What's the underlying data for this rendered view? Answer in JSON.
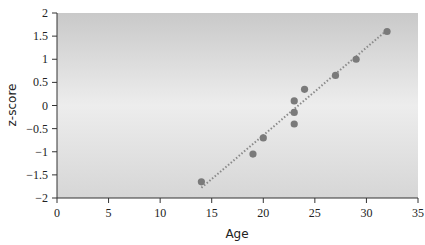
{
  "chart_data": {
    "type": "scatter",
    "title": "",
    "xlabel": "Age",
    "ylabel": "z-score",
    "xlim": [
      0,
      35
    ],
    "ylim": [
      -2,
      2
    ],
    "x_ticks": [
      0,
      5,
      10,
      15,
      20,
      25,
      30,
      35
    ],
    "y_ticks": [
      -2,
      -1.5,
      -1,
      -0.5,
      0,
      0.5,
      1,
      1.5,
      2
    ],
    "x_tick_labels": [
      "0",
      "5",
      "10",
      "15",
      "20",
      "25",
      "30",
      "35"
    ],
    "y_tick_labels": [
      "−2",
      "−1.5",
      "−1",
      "−0.5",
      "0",
      "0.5",
      "1",
      "1.5",
      "2"
    ],
    "grid": false,
    "legend": null,
    "series": [
      {
        "name": "observations",
        "marker": "circle",
        "color": "#7a7a7a",
        "points": [
          {
            "x": 14,
            "y": -1.65
          },
          {
            "x": 19,
            "y": -1.05
          },
          {
            "x": 20,
            "y": -0.7
          },
          {
            "x": 23,
            "y": -0.4
          },
          {
            "x": 23,
            "y": -0.15
          },
          {
            "x": 23,
            "y": 0.1
          },
          {
            "x": 24,
            "y": 0.35
          },
          {
            "x": 27,
            "y": 0.65
          },
          {
            "x": 29,
            "y": 1.0
          },
          {
            "x": 32,
            "y": 1.6
          }
        ]
      },
      {
        "name": "trend line",
        "style": "dotted",
        "color": "#8a8a8a",
        "points": [
          {
            "x": 14,
            "y": -1.78
          },
          {
            "x": 32,
            "y": 1.63
          }
        ]
      }
    ],
    "plot_background": {
      "gradient": "vertical",
      "top": "#c9c9c9",
      "middle": "#ededed",
      "bottom": "#d6d6d6"
    }
  }
}
